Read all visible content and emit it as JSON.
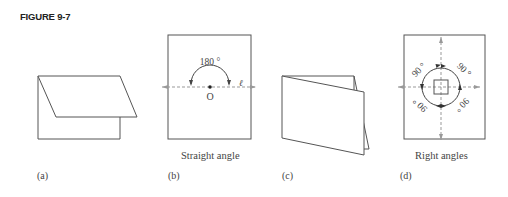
{
  "figure": {
    "title": "FIGURE 9-7"
  },
  "panels": [
    {
      "id": "a",
      "label": "(a)",
      "caption": ""
    },
    {
      "id": "b",
      "label": "(b)",
      "caption": "Straight angle",
      "angle_text": "180 °",
      "point_label": "O",
      "line_label": "ℓ"
    },
    {
      "id": "c",
      "label": "(c)",
      "caption": ""
    },
    {
      "id": "d",
      "label": "(d)",
      "caption": "Right angles",
      "angle_labels": [
        "90 °",
        "90 °",
        "90 °",
        "90 °"
      ]
    }
  ],
  "colors": {
    "stroke": "#444444",
    "dashed": "#999999",
    "text": "#444444"
  }
}
